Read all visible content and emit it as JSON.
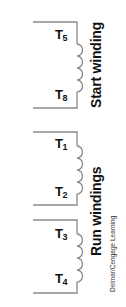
{
  "diagram": {
    "type": "motor-winding-schematic",
    "line_color": "#8a8a8a",
    "text_color": "#111111",
    "groups": [
      {
        "label": "Start winding",
        "coils": [
          {
            "top_terminal": {
              "letter": "T",
              "number": "5"
            },
            "bottom_terminal": {
              "letter": "T",
              "number": "8"
            }
          }
        ]
      },
      {
        "label": "Run windings",
        "coils": [
          {
            "top_terminal": {
              "letter": "T",
              "number": "1"
            },
            "bottom_terminal": {
              "letter": "T",
              "number": "2"
            }
          },
          {
            "top_terminal": {
              "letter": "T",
              "number": "3"
            },
            "bottom_terminal": {
              "letter": "T",
              "number": "4"
            }
          }
        ]
      }
    ],
    "credit": "Delmar/Cengage Learning"
  }
}
